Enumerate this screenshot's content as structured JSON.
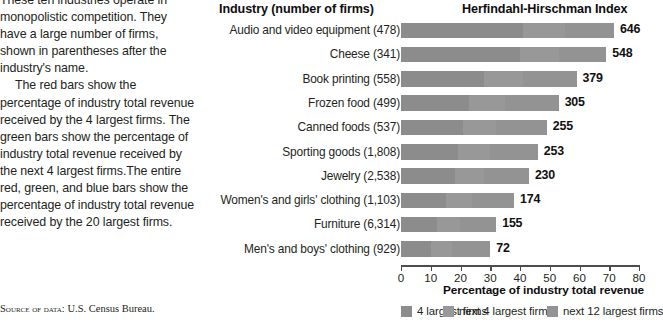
{
  "description": {
    "paragraph1": "These ten industries operate in monopolistic competition. They have a large number of firms, shown in parentheses after the industry's name.",
    "paragraph2": "The red bars show the percentage of industry total revenue received by the 4 largest firms. The green bars show the percentage of industry total revenue received by the next 4 largest firms.The entire red, green, and blue bars show the percentage of industry total revenue received by the 20 largest firms."
  },
  "source_note": {
    "label": "Source of data:",
    "value": "U.S. Census Bureau."
  },
  "headers": {
    "industry": "Industry (number of firms)",
    "hhi": "Herfindahl-Hirschman Index"
  },
  "chart_data": {
    "type": "bar",
    "orientation": "horizontal",
    "stacked": true,
    "title": "",
    "xlabel": "Percentage of industry total revenue",
    "ylabel": "",
    "xlim": [
      0,
      80
    ],
    "xticks": [
      0,
      10,
      20,
      30,
      40,
      50,
      60,
      70,
      80
    ],
    "xtick_labels": [
      "0",
      "10",
      "20",
      "30",
      "40",
      "50",
      "60",
      "70",
      "80"
    ],
    "grid": false,
    "legend_position": "bottom",
    "categories": [
      "Audio and video equipment (478)",
      "Cheese (341)",
      "Book printing (558)",
      "Frozen food (499)",
      "Canned foods (537)",
      "Sporting goods (1,808)",
      "Jewelry (2,538)",
      "Women's and girls' clothing (1,103)",
      "Furniture (6,314)",
      "Men's and boys' clothing (929)"
    ],
    "series": [
      {
        "name": "4 largest firms",
        "color": "#8c8c8c",
        "values": [
          41,
          40,
          28,
          23,
          21,
          19,
          18,
          15,
          12,
          10
        ]
      },
      {
        "name": "next 4 largest firms",
        "color": "#989898",
        "values": [
          14,
          13,
          13,
          12,
          11,
          11,
          10,
          9,
          8,
          7
        ]
      },
      {
        "name": "next 12 largest firms",
        "color": "#939393",
        "values": [
          16.6,
          16,
          18,
          18,
          17,
          16,
          15,
          14,
          12,
          13
        ]
      }
    ],
    "totals": [
      71.6,
      69,
      59,
      53,
      49,
      46,
      43,
      38,
      32,
      30
    ],
    "data_labels": [
      "646",
      "548",
      "379",
      "305",
      "255",
      "253",
      "230",
      "174",
      "155",
      "72"
    ],
    "data_label_name": "Herfindahl-Hirschman Index"
  }
}
